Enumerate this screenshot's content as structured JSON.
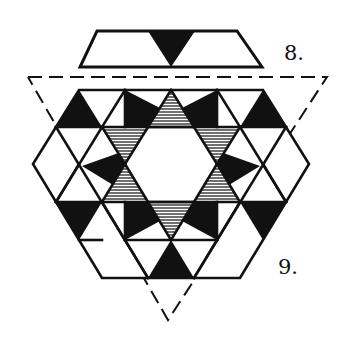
{
  "figures": [
    {
      "number": "8.",
      "shape": "trapezoid-tile",
      "description": "Trapezoid tile with a black downward triangle in the center"
    },
    {
      "number": "9.",
      "shape": "hexagonal-tiling",
      "description": "Hexagon composed of black, white and hatched triangles and kites forming a six-pointed star around a white central hexagon, inside a dashed downward triangle"
    }
  ],
  "labels": {
    "fig8": "8.",
    "fig9": "9."
  },
  "colors": {
    "ink": "#111111",
    "paper": "#ffffff",
    "hatch": "#555555"
  }
}
